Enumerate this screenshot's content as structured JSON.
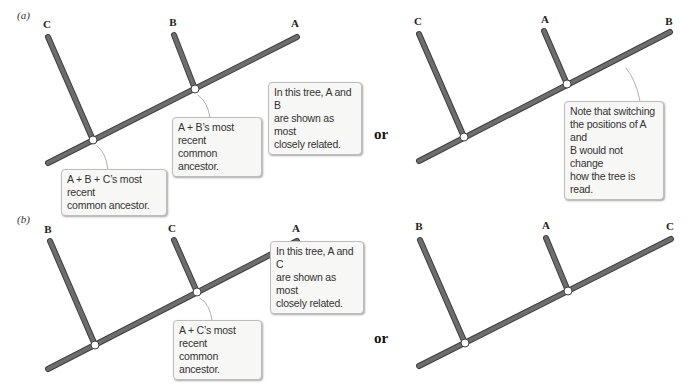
{
  "colors": {
    "branch": "#6d6d6d",
    "branch_edge": "#3f3f3f",
    "node_fill": "#ffffff",
    "callout_bg": "#f7f7f5"
  },
  "separator_word": "or",
  "panels": [
    {
      "label": "(a)",
      "left_tree": {
        "taxa": [
          "C",
          "B",
          "A"
        ],
        "callouts": {
          "relation": "In this tree, A and B\nare shown as most\nclosely related.",
          "inner_node": "A + B’s most recent\ncommon ancestor.",
          "root_node": "A + B + C’s most recent\ncommon ancestor."
        }
      },
      "right_tree": {
        "taxa": [
          "C",
          "A",
          "B"
        ],
        "callouts": {
          "note": "Note that switching\nthe positions of A and\nB would not change\nhow the tree is read."
        }
      }
    },
    {
      "label": "(b)",
      "left_tree": {
        "taxa": [
          "B",
          "C",
          "A"
        ],
        "callouts": {
          "relation": "In this tree, A and C\nare shown as most\nclosely related.",
          "inner_node": "A + C’s most recent\ncommon ancestor."
        }
      },
      "right_tree": {
        "taxa": [
          "B",
          "A",
          "C"
        ]
      }
    }
  ]
}
